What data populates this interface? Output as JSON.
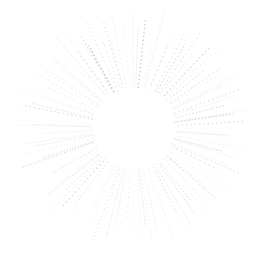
{
  "canvas": {
    "width": 268,
    "height": 263,
    "background_color": "#ffffff",
    "title": "sunburst-starburst-graphic"
  },
  "graphic": {
    "name": "sunburst",
    "description": "Radial starburst of faint dotted rays around an empty circular center",
    "center_x": 134,
    "center_y": 128,
    "inner_radius": 40,
    "outer_radius_min": 88,
    "outer_radius_max": 122,
    "ray_count": 104,
    "ray_color": "#d6d6da",
    "ray_color_light": "#eaeaee",
    "ray_color_dark": "#c4c4ca",
    "stroke_width_min": 0.55,
    "stroke_width_max": 1.5,
    "dash_on_min": 0.6,
    "dash_on_max": 2.2,
    "dash_gap_min": 1.1,
    "dash_gap_max": 3.4,
    "opacity_min": 0.3,
    "opacity_max": 0.95,
    "angle_jitter_deg": 1.6
  },
  "chart_data": {
    "type": "scatter",
    "title": "",
    "xlabel": "",
    "ylabel": "",
    "grid": false,
    "legend_position": "none",
    "xlim": [
      0,
      268
    ],
    "ylim": [
      0,
      263
    ],
    "series": [
      {
        "name": "rays",
        "angles_deg": [
          0,
          3.46,
          6.92,
          10.38,
          13.85,
          17.31,
          20.77,
          24.23,
          27.69,
          31.15,
          34.62,
          38.08,
          41.54,
          45.0,
          48.46,
          51.92,
          55.38,
          58.85,
          62.31,
          65.77,
          69.23,
          72.69,
          76.15,
          79.62,
          83.08,
          86.54,
          90.0,
          93.46,
          96.92,
          100.38,
          103.85,
          107.31,
          110.77,
          114.23,
          117.69,
          121.15,
          124.62,
          128.08,
          131.54,
          135.0,
          138.46,
          141.92,
          145.38,
          148.85,
          152.31,
          155.77,
          159.23,
          162.69,
          166.15,
          169.62,
          173.08,
          176.54,
          180.0,
          183.46,
          186.92,
          190.38,
          193.85,
          197.31,
          200.77,
          204.23,
          207.69,
          211.15,
          214.62,
          218.08,
          221.54,
          225.0,
          228.46,
          231.92,
          235.38,
          238.85,
          242.31,
          245.77,
          249.23,
          252.69,
          256.15,
          259.62,
          263.08,
          266.54,
          270.0,
          273.46,
          276.92,
          280.38,
          283.85,
          287.31,
          290.77,
          294.23,
          297.69,
          301.15,
          304.62,
          308.08,
          311.54,
          315.0,
          318.46,
          321.92,
          325.38,
          328.85,
          332.31,
          335.77,
          339.23,
          342.69,
          346.15,
          349.62,
          353.08,
          356.54
        ],
        "outer_radii": [
          112,
          96,
          104,
          119,
          91,
          108,
          100,
          116,
          94,
          106,
          120,
          98,
          110,
          102,
          117,
          93,
          105,
          114,
          97,
          109,
          121,
          95,
          103,
          118,
          99,
          111,
          107,
          92,
          115,
          101,
          113,
          96,
          120,
          104,
          90,
          108,
          117,
          98,
          106,
          122,
          94,
          110,
          100,
          116,
          93,
          105,
          119,
          97,
          112,
          102,
          109,
          95,
          118,
          103,
          91,
          114,
          107,
          99,
          120,
          96,
          111,
          104,
          116,
          92,
          108,
          101,
          121,
          97,
          113,
          106,
          94,
          117,
          100,
          110,
          98,
          119,
          105,
          93,
          115,
          102,
          109,
          96,
          122,
          103,
          91,
          112,
          107,
          99,
          118,
          95,
          110,
          104,
          116,
          90,
          108,
          101,
          120,
          97,
          113,
          106,
          94,
          117,
          100,
          111
        ]
      }
    ]
  }
}
